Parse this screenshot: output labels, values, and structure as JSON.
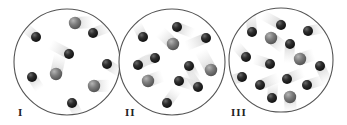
{
  "figure": {
    "colors": {
      "dark_particle": "#2b2b2b",
      "gray_particle": "#7a7a7a",
      "container_stroke": "#555555",
      "trail": "#d6d6d6"
    },
    "panels": [
      {
        "label": "I",
        "cx": 67,
        "cy": 62,
        "r": 53,
        "label_x": 18,
        "label_y": 106,
        "particles": [
          {
            "type": "gray",
            "x": 75,
            "y": 23
          },
          {
            "type": "dark",
            "x": 36,
            "y": 37
          },
          {
            "type": "dark",
            "x": 93,
            "y": 33
          },
          {
            "type": "dark",
            "x": 69,
            "y": 54
          },
          {
            "type": "dark",
            "x": 107,
            "y": 64
          },
          {
            "type": "gray",
            "x": 56,
            "y": 74
          },
          {
            "type": "dark",
            "x": 32,
            "y": 77
          },
          {
            "type": "gray",
            "x": 94,
            "y": 86
          },
          {
            "type": "dark",
            "x": 72,
            "y": 103
          }
        ],
        "counts": {
          "dark": 6,
          "gray": 3
        }
      },
      {
        "label": "II",
        "cx": 172,
        "cy": 62,
        "r": 53,
        "label_x": 125,
        "label_y": 106,
        "particles": [
          {
            "type": "dark",
            "x": 177,
            "y": 27
          },
          {
            "type": "dark",
            "x": 143,
            "y": 37
          },
          {
            "type": "dark",
            "x": 206,
            "y": 38
          },
          {
            "type": "gray",
            "x": 173,
            "y": 44
          },
          {
            "type": "dark",
            "x": 155,
            "y": 58
          },
          {
            "type": "dark",
            "x": 138,
            "y": 65
          },
          {
            "type": "dark",
            "x": 189,
            "y": 66
          },
          {
            "type": "gray",
            "x": 211,
            "y": 70
          },
          {
            "type": "gray",
            "x": 148,
            "y": 81
          },
          {
            "type": "dark",
            "x": 179,
            "y": 81
          },
          {
            "type": "dark",
            "x": 198,
            "y": 87
          },
          {
            "type": "dark",
            "x": 167,
            "y": 103
          }
        ],
        "counts": {
          "dark": 9,
          "gray": 3
        }
      },
      {
        "label": "III",
        "cx": 281,
        "cy": 60,
        "r": 52,
        "label_x": 231,
        "label_y": 106,
        "particles": [
          {
            "type": "dark",
            "x": 281,
            "y": 25
          },
          {
            "type": "dark",
            "x": 252,
            "y": 32
          },
          {
            "type": "dark",
            "x": 308,
            "y": 31
          },
          {
            "type": "gray",
            "x": 271,
            "y": 38
          },
          {
            "type": "dark",
            "x": 290,
            "y": 44
          },
          {
            "type": "dark",
            "x": 246,
            "y": 57
          },
          {
            "type": "gray",
            "x": 300,
            "y": 59
          },
          {
            "type": "dark",
            "x": 270,
            "y": 64
          },
          {
            "type": "dark",
            "x": 320,
            "y": 66
          },
          {
            "type": "dark",
            "x": 242,
            "y": 77
          },
          {
            "type": "dark",
            "x": 287,
            "y": 79
          },
          {
            "type": "dark",
            "x": 260,
            "y": 85
          },
          {
            "type": "dark",
            "x": 307,
            "y": 85
          },
          {
            "type": "dark",
            "x": 272,
            "y": 98
          },
          {
            "type": "gray",
            "x": 290,
            "y": 97
          }
        ],
        "counts": {
          "dark": 12,
          "gray": 3
        }
      }
    ]
  }
}
